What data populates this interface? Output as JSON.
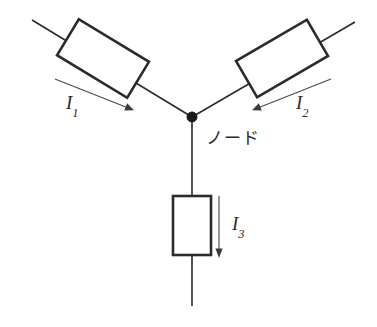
{
  "diagram": {
    "type": "circuit-schematic",
    "colors": {
      "background": "#ffffff",
      "wire": "#2b2b2b",
      "resistor_outline": "#2b2b2b",
      "resistor_fill": "#ffffff",
      "node_dot": "#1a1a1a",
      "arrow": "#3a3a3a",
      "text": "#2b2b2b"
    },
    "node": {
      "label": "ノード",
      "x": 192,
      "y": 117,
      "radius": 5
    },
    "branches": [
      {
        "id": "branch-1",
        "current_label": "I",
        "current_subscript": "1",
        "direction": "toward-node",
        "arrow_from": [
          55,
          79
        ],
        "arrow_to": [
          133,
          110
        ],
        "wire_from": [
          32,
          20
        ],
        "wire_to": [
          192,
          117
        ],
        "resistor": {
          "center_x": 103,
          "center_y": 58,
          "width": 82,
          "height": 42,
          "rotation_deg": 33
        }
      },
      {
        "id": "branch-2",
        "current_label": "I",
        "current_subscript": "2",
        "direction": "toward-node",
        "arrow_from": [
          330,
          79
        ],
        "arrow_to": [
          252,
          110
        ],
        "wire_from": [
          355,
          22
        ],
        "wire_to": [
          192,
          117
        ],
        "resistor": {
          "center_x": 281,
          "center_y": 58,
          "width": 82,
          "height": 42,
          "rotation_deg": -33
        }
      },
      {
        "id": "branch-3",
        "current_label": "I",
        "current_subscript": "3",
        "direction": "away-from-node",
        "arrow_from": [
          219,
          196
        ],
        "arrow_to": [
          219,
          256
        ],
        "wire_from": [
          192,
          117
        ],
        "wire_to": [
          192,
          306
        ],
        "resistor": {
          "center_x": 192,
          "center_y": 225,
          "width": 38,
          "height": 59,
          "rotation_deg": 0
        }
      }
    ]
  }
}
